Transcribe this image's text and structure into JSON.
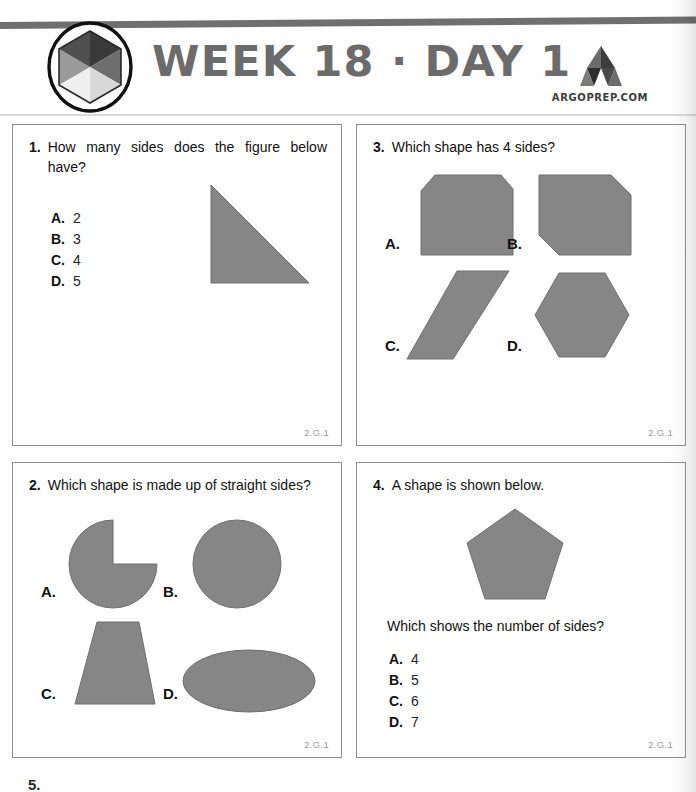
{
  "header": {
    "title": "WEEK 18 · DAY 1",
    "brand_text": "ARGOPREP.COM",
    "badge_icon": "hexagon-logo-icon",
    "brand_icon": "argoprep-a-mark-icon"
  },
  "colors": {
    "shape_fill": "#868686",
    "shape_stroke": "#6f6f6f",
    "title_gray": "#6b6b6b",
    "rule_gray": "#6f6f6f",
    "card_border": "#8e8e8e",
    "standard_label": "#9a9a9a"
  },
  "questions": [
    {
      "number": "1.",
      "prompt": "How many sides does the figure below have?",
      "standard": "2.G.1",
      "choices": [
        {
          "letter": "A.",
          "value": "2"
        },
        {
          "letter": "B.",
          "value": "3"
        },
        {
          "letter": "C.",
          "value": "4"
        },
        {
          "letter": "D.",
          "value": "5"
        }
      ],
      "figure": "right-triangle"
    },
    {
      "number": "2.",
      "prompt": "Which shape is made up of straight sides?",
      "standard": "2.G.1",
      "choices": [
        {
          "letter": "A.",
          "value": "",
          "figure": "circle-with-quarter-removed"
        },
        {
          "letter": "B.",
          "value": "",
          "figure": "circle"
        },
        {
          "letter": "C.",
          "value": "",
          "figure": "trapezoid"
        },
        {
          "letter": "D.",
          "value": "",
          "figure": "ellipse"
        }
      ]
    },
    {
      "number": "3.",
      "prompt": "Which shape has 4 sides?",
      "standard": "2.G.1",
      "choices": [
        {
          "letter": "A.",
          "value": "",
          "figure": "square-two-top-corners-cut"
        },
        {
          "letter": "B.",
          "value": "",
          "figure": "square-two-opposite-corners-cut"
        },
        {
          "letter": "C.",
          "value": "",
          "figure": "parallelogram"
        },
        {
          "letter": "D.",
          "value": "",
          "figure": "hexagon"
        }
      ]
    },
    {
      "number": "4.",
      "prompt": "A shape is shown below.",
      "sub_prompt": "Which shows the number of sides?",
      "standard": "2.G.1",
      "choices": [
        {
          "letter": "A.",
          "value": "4"
        },
        {
          "letter": "B.",
          "value": "5"
        },
        {
          "letter": "C.",
          "value": "6"
        },
        {
          "letter": "D.",
          "value": "7"
        }
      ],
      "figure": "pentagon"
    }
  ],
  "next_question_number": "5."
}
